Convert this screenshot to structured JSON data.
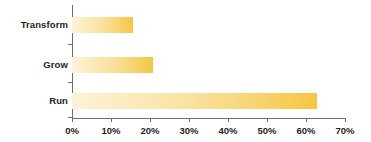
{
  "chart_data": {
    "type": "bar",
    "orientation": "horizontal",
    "title": "",
    "xlabel": "",
    "ylabel": "",
    "categories": [
      "Transform",
      "Grow",
      "Run"
    ],
    "values": [
      15.6,
      20.8,
      62.8
    ],
    "value_format": "percent",
    "xlim": [
      0,
      70
    ],
    "xticks": [
      0,
      10,
      20,
      30,
      40,
      50,
      60,
      70
    ],
    "xtick_labels": [
      "0%",
      "10%",
      "20%",
      "30%",
      "40%",
      "50%",
      "60%",
      "70%"
    ],
    "grid": false,
    "legend": false,
    "legend_position": "none",
    "series": [
      {
        "name": "",
        "values": [
          15.6,
          20.8,
          62.8
        ]
      }
    ],
    "colors": {
      "bar_fill_start": "#fdf3d8",
      "bar_fill_end": "#f6c63f",
      "axis": "#6d6e71",
      "text": "#231f20",
      "background": "#ffffff"
    }
  }
}
